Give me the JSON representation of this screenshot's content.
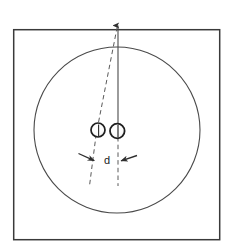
{
  "figure": {
    "title": "",
    "background_color": "#ffffff",
    "line_color": "#3a3a3a",
    "dash_color": "#555555",
    "text_color": "#1a1a1a",
    "frame": {
      "name": "outer-square-frame",
      "x": 13,
      "y": 29,
      "width": 207,
      "height": 211,
      "stroke_width": 1.4
    },
    "big_circle": {
      "name": "large-circle",
      "cx": 117,
      "cy": 130,
      "r": 83,
      "stroke_width": 1.1
    },
    "vertical_axis": {
      "name": "vertical-reference-line",
      "x1": 118,
      "y1": 24,
      "x2": 118,
      "y2": 133,
      "stroke_width": 1.1,
      "arrow_at": "top"
    },
    "slanted_dashed_line": {
      "name": "slanted-dashed-line",
      "x1": 117,
      "y1": 26,
      "x2": 97,
      "y2": 133,
      "stroke_width": 1.0,
      "dash_pattern": "4,3"
    },
    "spheres": [
      {
        "name": "left-sphere",
        "cx": 98,
        "cy": 130,
        "r": 7.0
      },
      {
        "name": "right-sphere",
        "cx": 117,
        "cy": 131,
        "r": 7.2
      }
    ],
    "drop_lines": [
      {
        "name": "left-drop-dashed-line",
        "x1": 97,
        "y1": 133,
        "x2": 90,
        "y2": 183,
        "dash_pattern": "4,3"
      },
      {
        "name": "right-drop-dashed-line",
        "x1": 118,
        "y1": 136,
        "x2": 118,
        "y2": 185,
        "dash_pattern": "4,3"
      }
    ],
    "dimension": {
      "name": "distance-dimension",
      "label": "d",
      "label_x": 107,
      "label_y": 163,
      "left_arrow": {
        "name": "left-dimension-arrow",
        "x1": 79,
        "y1": 154,
        "x2": 96,
        "y2": 161
      },
      "right_arrow": {
        "name": "right-dimension-arrow",
        "x1": 136,
        "y1": 156,
        "x2": 119,
        "y2": 161
      }
    }
  }
}
